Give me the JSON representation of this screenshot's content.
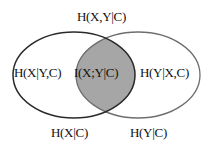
{
  "diagram": {
    "type": "venn",
    "labels": {
      "joint_entropy": "H(X,Y|C)",
      "x_given_y": "H(X|Y,C)",
      "mutual_information": "I(X;Y|C)",
      "y_given_x": "H(Y|X,C)",
      "entropy_x": "H(X|C)",
      "entropy_y": "H(Y|C)"
    },
    "colors": {
      "background": "#ffffff",
      "left_ellipse_stroke": "#2a2a2a",
      "right_ellipse_stroke": "#6e6e6e",
      "intersection_fill": "#a6a6a6",
      "text": "#111111"
    }
  }
}
